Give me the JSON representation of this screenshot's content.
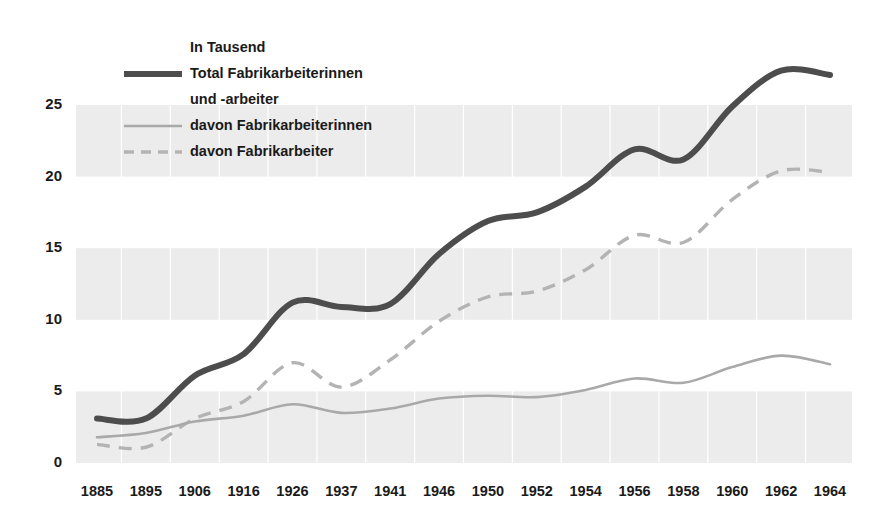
{
  "chart_data": {
    "type": "line",
    "title": "",
    "subtitle": "",
    "unit_note": "In Tausend",
    "xlabel": "",
    "ylabel": "",
    "grid": "horizontal-bands",
    "legend_position": "top-left-inside",
    "xlim": [
      1885,
      1964
    ],
    "ylim": [
      0,
      28
    ],
    "yticks": [
      0,
      5,
      10,
      15,
      20,
      25
    ],
    "ytick_labels": [
      "0",
      "5",
      "10",
      "15",
      "20",
      "25"
    ],
    "categories": [
      "1885",
      "1895",
      "1906",
      "1916",
      "1926",
      "1937",
      "1941",
      "1946",
      "1950",
      "1952",
      "1954",
      "1956",
      "1958",
      "1960",
      "1962",
      "1964"
    ],
    "series": [
      {
        "name": "Total Fabrikarbeiterinnen und -arbeiter",
        "style": "solid-thick",
        "color": "#4d4d4d",
        "values": [
          3.1,
          3.1,
          6.1,
          7.6,
          11.2,
          10.9,
          11.1,
          14.6,
          16.9,
          17.5,
          19.3,
          21.9,
          21.2,
          24.9,
          27.4,
          27.1
        ]
      },
      {
        "name": "davon Fabrikarbeiterinnen",
        "style": "solid-thin",
        "color": "#a9a9a9",
        "values": [
          1.8,
          2.1,
          2.9,
          3.3,
          4.1,
          3.5,
          3.8,
          4.5,
          4.7,
          4.6,
          5.1,
          5.9,
          5.6,
          6.7,
          7.5,
          6.9
        ]
      },
      {
        "name": "davon Fabrikarbeiter",
        "style": "dashed",
        "color": "#b3b3b3",
        "values": [
          1.3,
          1.1,
          3.1,
          4.3,
          7.0,
          5.3,
          7.2,
          9.9,
          11.6,
          12.0,
          13.5,
          15.9,
          15.4,
          18.4,
          20.4,
          20.3
        ]
      }
    ],
    "annotations": []
  },
  "legend": {
    "unit_label": "In Tausend",
    "items": [
      {
        "label_line1": "Total Fabrikarbeiterinnen",
        "label_line2": "und -arbeiter",
        "style": "solid-thick"
      },
      {
        "label_line1": "davon Fabrikarbeiterinnen",
        "label_line2": "",
        "style": "solid-thin"
      },
      {
        "label_line1": "davon Fabrikarbeiter",
        "label_line2": "",
        "style": "dashed"
      }
    ]
  },
  "axis": {
    "y_labels": [
      "25",
      "20",
      "15",
      "10",
      "5",
      "0"
    ],
    "x_labels": [
      "1885",
      "1895",
      "1906",
      "1916",
      "1926",
      "1937",
      "1941",
      "1946",
      "1950",
      "1952",
      "1954",
      "1956",
      "1958",
      "1960",
      "1962",
      "1964"
    ]
  },
  "colors": {
    "total": "#4d4d4d",
    "women": "#a9a9a9",
    "men": "#b3b3b3",
    "band": "#ececec",
    "text": "#1a1a1a",
    "background": "#ffffff"
  }
}
